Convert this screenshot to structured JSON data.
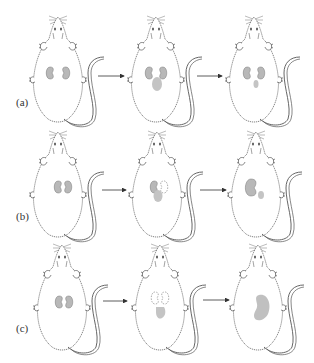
{
  "figure": {
    "rows": [
      {
        "label": "(a)",
        "panels": [
          {
            "state": "normal-kidneys"
          },
          {
            "state": "kidney-with-growth-below"
          },
          {
            "state": "kidneys-with-small-remnant"
          }
        ]
      },
      {
        "label": "(b)",
        "panels": [
          {
            "state": "normal-kidneys"
          },
          {
            "state": "one-kidney-removed-growth-below"
          },
          {
            "state": "single-enlarged-kidney-small-growth"
          }
        ]
      },
      {
        "label": "(c)",
        "panels": [
          {
            "state": "normal-kidneys"
          },
          {
            "state": "both-kidneys-removed-growth-below"
          },
          {
            "state": "single-large-organ"
          }
        ]
      }
    ],
    "colors": {
      "outline": "#555555",
      "organ_fill": "#b8b8b8",
      "organ_stroke": "#777777",
      "arrow": "#333333",
      "background": "#ffffff"
    }
  }
}
